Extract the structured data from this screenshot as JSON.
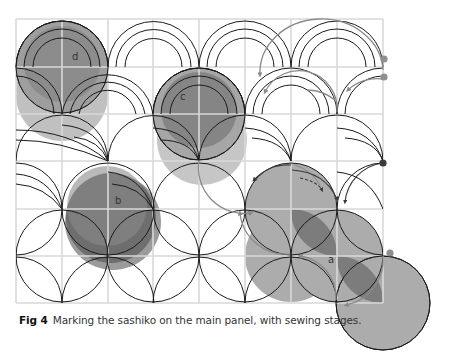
{
  "figure": {
    "number_label": "Fig 4",
    "caption": "Marking the sashiko on the main panel, with sewing stages.",
    "stage_labels": [
      "a",
      "b",
      "c",
      "d"
    ],
    "grid": {
      "columns": 8,
      "rows": 6,
      "line_color": "#d9d9d9"
    },
    "colors": {
      "stitch_line": "#1a1a1a",
      "stage_fill_light": "#b3b3b3",
      "stage_fill_mid": "#8c8c8c",
      "stage_fill_dark": "#6e6e6e",
      "arrow_gray": "#8a8a8a",
      "arrow_dark": "#3a3a3a",
      "dot_dark": "#3a3a3a",
      "dot_gray": "#8f8f8f"
    }
  }
}
